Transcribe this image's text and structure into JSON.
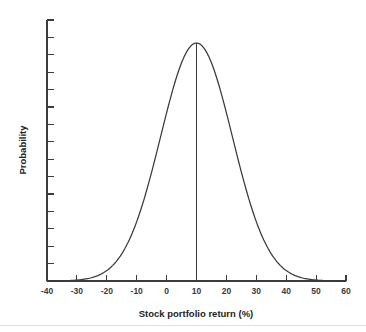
{
  "chart_data": {
    "type": "line",
    "title": "",
    "xlabel": "Stock portfolio return (%)",
    "ylabel": "Probability",
    "xlim": [
      -40,
      60
    ],
    "ylim": [
      0,
      1
    ],
    "grid": false,
    "legend": null,
    "xticks": [
      -40,
      -30,
      -20,
      -10,
      0,
      10,
      20,
      30,
      40,
      50,
      60
    ],
    "xtick_labels": [
      "-40",
      "-30",
      "-20",
      "-10",
      "0",
      "10",
      "20",
      "30",
      "40",
      "50",
      "60"
    ],
    "ytick_count": 16,
    "ytick_labels": [],
    "distribution": {
      "kind": "normal",
      "mean": 10,
      "std_dev": 12,
      "peak_value": 1.0
    },
    "annotations": [
      {
        "name": "mean-line",
        "kind": "vertical-line",
        "x": 10,
        "from_y": 0,
        "to_y": 1.0
      }
    ],
    "series": [
      {
        "name": "Probability density of stock portfolio return",
        "x": [
          -40,
          -38,
          -36,
          -34,
          -32,
          -30,
          -28,
          -26,
          -24,
          -22,
          -20,
          -18,
          -16,
          -14,
          -12,
          -10,
          -8,
          -6,
          -4,
          -2,
          0,
          2,
          4,
          6,
          8,
          10,
          12,
          14,
          16,
          18,
          20,
          22,
          24,
          26,
          28,
          30,
          32,
          34,
          36,
          38,
          40,
          42,
          44,
          46,
          48,
          50,
          52,
          54,
          56,
          58,
          60
        ],
        "values": [
          0.002,
          0.004,
          0.006,
          0.009,
          0.014,
          0.021,
          0.03,
          0.042,
          0.058,
          0.078,
          0.105,
          0.135,
          0.173,
          0.217,
          0.268,
          0.325,
          0.387,
          0.453,
          0.522,
          0.589,
          0.655,
          0.717,
          0.775,
          0.846,
          0.9,
          1.0,
          0.946,
          0.9,
          0.846,
          0.775,
          0.717,
          0.655,
          0.589,
          0.522,
          0.453,
          0.387,
          0.325,
          0.268,
          0.217,
          0.173,
          0.135,
          0.105,
          0.078,
          0.058,
          0.042,
          0.03,
          0.021,
          0.014,
          0.009,
          0.006,
          0.004
        ]
      }
    ]
  },
  "axis": {
    "x_title": "Stock portfolio return (%)",
    "y_title": "Probability"
  }
}
